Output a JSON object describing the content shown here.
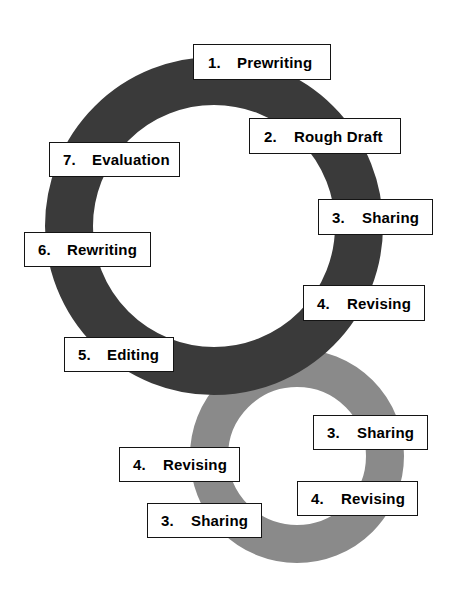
{
  "diagram": {
    "background_color": "#ffffff",
    "rings": [
      {
        "name": "primary-cycle-ring",
        "color": "#3a3a3a",
        "center_x": 214,
        "center_y": 226,
        "outer_radius": 169,
        "thickness": 48
      },
      {
        "name": "secondary-cycle-ring",
        "color": "#8a8a8a",
        "center_x": 297,
        "center_y": 456,
        "outer_radius": 107,
        "thickness": 38
      }
    ]
  },
  "labels": [
    {
      "id": "step-1-prewriting",
      "number": "1.",
      "text": "Prewriting",
      "ring": "primary-cycle-ring",
      "left": 193,
      "top": 44,
      "width": 138,
      "height": 36,
      "font_size": 15,
      "pad_left": 14,
      "gap": 16
    },
    {
      "id": "step-2-rough-draft",
      "number": "2.",
      "text": "Rough Draft",
      "ring": "primary-cycle-ring",
      "left": 249,
      "top": 118,
      "width": 152,
      "height": 36,
      "font_size": 15,
      "pad_left": 14,
      "gap": 17
    },
    {
      "id": "step-3-sharing",
      "number": "3.",
      "text": "Sharing",
      "ring": "primary-cycle-ring",
      "left": 318,
      "top": 199,
      "width": 115,
      "height": 36,
      "font_size": 15,
      "pad_left": 13,
      "gap": 17
    },
    {
      "id": "step-4-revising",
      "number": "4.",
      "text": "Revising",
      "ring": "primary-cycle-ring",
      "left": 303,
      "top": 285,
      "width": 122,
      "height": 36,
      "font_size": 15,
      "pad_left": 13,
      "gap": 17
    },
    {
      "id": "step-5-editing",
      "number": "5.",
      "text": "Editing",
      "ring": "primary-cycle-ring",
      "left": 64,
      "top": 337,
      "width": 110,
      "height": 35,
      "font_size": 15,
      "pad_left": 13,
      "gap": 16
    },
    {
      "id": "step-6-rewriting",
      "number": "6.",
      "text": "Rewriting",
      "ring": "primary-cycle-ring",
      "left": 24,
      "top": 232,
      "width": 127,
      "height": 35,
      "font_size": 15,
      "pad_left": 13,
      "gap": 16
    },
    {
      "id": "step-7-evaluation",
      "number": "7.",
      "text": "Evaluation",
      "ring": "primary-cycle-ring",
      "left": 49,
      "top": 142,
      "width": 131,
      "height": 35,
      "font_size": 15,
      "pad_left": 13,
      "gap": 16
    },
    {
      "id": "loop-3-sharing-right",
      "number": "3.",
      "text": "Sharing",
      "ring": "secondary-cycle-ring",
      "left": 313,
      "top": 415,
      "width": 115,
      "height": 35,
      "font_size": 15,
      "pad_left": 13,
      "gap": 17
    },
    {
      "id": "loop-4-revising-right",
      "number": "4.",
      "text": "Revising",
      "ring": "secondary-cycle-ring",
      "left": 297,
      "top": 481,
      "width": 121,
      "height": 35,
      "font_size": 15,
      "pad_left": 13,
      "gap": 17
    },
    {
      "id": "loop-4-revising-left",
      "number": "4.",
      "text": "Revising",
      "ring": "secondary-cycle-ring",
      "left": 119,
      "top": 447,
      "width": 121,
      "height": 35,
      "font_size": 15,
      "pad_left": 13,
      "gap": 17
    },
    {
      "id": "loop-3-sharing-left",
      "number": "3.",
      "text": "Sharing",
      "ring": "secondary-cycle-ring",
      "left": 147,
      "top": 503,
      "width": 115,
      "height": 35,
      "font_size": 15,
      "pad_left": 13,
      "gap": 17
    }
  ]
}
